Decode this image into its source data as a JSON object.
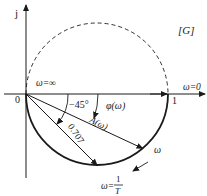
{
  "diagram": {
    "plane_label": "[G]",
    "axis_imag_label": "j",
    "origin_label": "0",
    "unit_label": "1",
    "omega_zero_label": "ω=0",
    "omega_inf_label": "ω=∞",
    "angle_45_label": "−45°",
    "phase_label": "φ(ω)",
    "magnitude_label": "A(ω)",
    "radius_label": "0.707",
    "omega_label": "ω",
    "omega_break_prefix": "ω=",
    "omega_break_num": "1",
    "omega_break_den": "T",
    "colors": {
      "stroke": "#1a1a1a",
      "background": "#ffffff"
    },
    "semicircle": {
      "center_re": 0.5,
      "radius": 0.5,
      "upper_style": "dashed",
      "lower_style": "solid"
    },
    "vectors": [
      {
        "name": "break-vector",
        "angle_deg": -45,
        "magnitude": 0.707
      },
      {
        "name": "general-vector",
        "angle_deg": -25,
        "magnitude": 0.906
      }
    ]
  }
}
